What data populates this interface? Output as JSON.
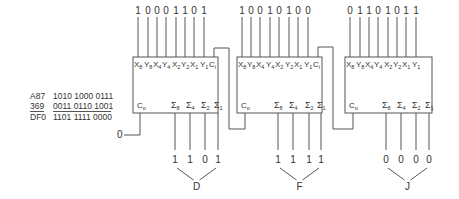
{
  "calculation": {
    "rows": [
      {
        "label": "A87",
        "binary": "1010 1000 0111",
        "underline": false
      },
      {
        "label": "369",
        "binary": "0011 0110 1001",
        "underline": true
      },
      {
        "label": "DF0",
        "binary": "1101 1111 0000",
        "underline": false
      }
    ]
  },
  "carry_in_initial": "0",
  "adders": [
    {
      "id": "adder-1",
      "inputs": [
        "1",
        "0",
        "0",
        "0",
        "1",
        "1",
        "0",
        "1"
      ],
      "input_pins": [
        {
          "base": "X",
          "sub": "8"
        },
        {
          "base": "Y",
          "sub": "8"
        },
        {
          "base": "X",
          "sub": "4"
        },
        {
          "base": "Y",
          "sub": "4"
        },
        {
          "base": "X",
          "sub": "2"
        },
        {
          "base": "Y",
          "sub": "2"
        },
        {
          "base": "X",
          "sub": "1"
        },
        {
          "base": "Y",
          "sub": "1"
        }
      ],
      "carry_in_label": {
        "base": "C",
        "sub": "i"
      },
      "carry_out_label": {
        "base": "C",
        "sub": "o"
      },
      "output_pins": [
        {
          "base": "Σ",
          "sub": "8"
        },
        {
          "base": "Σ",
          "sub": "4"
        },
        {
          "base": "Σ",
          "sub": "2"
        },
        {
          "base": "Σ",
          "sub": "1"
        }
      ],
      "outputs": [
        "1",
        "1",
        "0",
        "1"
      ],
      "group_label": "D"
    },
    {
      "id": "adder-2",
      "inputs": [
        "1",
        "0",
        "0",
        "1",
        "0",
        "1",
        "0",
        "0"
      ],
      "input_pins": [
        {
          "base": "X",
          "sub": "8"
        },
        {
          "base": "Y",
          "sub": "8"
        },
        {
          "base": "X",
          "sub": "4"
        },
        {
          "base": "Y",
          "sub": "4"
        },
        {
          "base": "X",
          "sub": "2"
        },
        {
          "base": "Y",
          "sub": "2"
        },
        {
          "base": "X",
          "sub": "1"
        },
        {
          "base": "Y",
          "sub": "1"
        }
      ],
      "carry_in_label": {
        "base": "C",
        "sub": "i"
      },
      "carry_out_label": {
        "base": "C",
        "sub": "o"
      },
      "output_pins": [
        {
          "base": "Σ",
          "sub": "8"
        },
        {
          "base": "Σ",
          "sub": "4"
        },
        {
          "base": "Σ",
          "sub": "2"
        },
        {
          "base": "Σ",
          "sub": "1"
        }
      ],
      "outputs": [
        "1",
        "1",
        "1",
        "1"
      ],
      "group_label": "F"
    },
    {
      "id": "adder-3",
      "inputs": [
        "0",
        "1",
        "1",
        "0",
        "1",
        "0",
        "1",
        "1"
      ],
      "input_pins": [
        {
          "base": "X",
          "sub": "8"
        },
        {
          "base": "Y",
          "sub": "8"
        },
        {
          "base": "X",
          "sub": "4"
        },
        {
          "base": "Y",
          "sub": "4"
        },
        {
          "base": "X",
          "sub": "2"
        },
        {
          "base": "Y",
          "sub": "2"
        },
        {
          "base": "X",
          "sub": "1"
        },
        {
          "base": "Y",
          "sub": "1"
        }
      ],
      "carry_in_label": null,
      "carry_out_label": {
        "base": "C",
        "sub": "o"
      },
      "output_pins": [
        {
          "base": "Σ",
          "sub": "8"
        },
        {
          "base": "Σ",
          "sub": "4"
        },
        {
          "base": "Σ",
          "sub": "2"
        },
        {
          "base": "Σ",
          "sub": "1"
        }
      ],
      "outputs": [
        "0",
        "0",
        "0",
        "0"
      ],
      "group_label": "J"
    }
  ]
}
